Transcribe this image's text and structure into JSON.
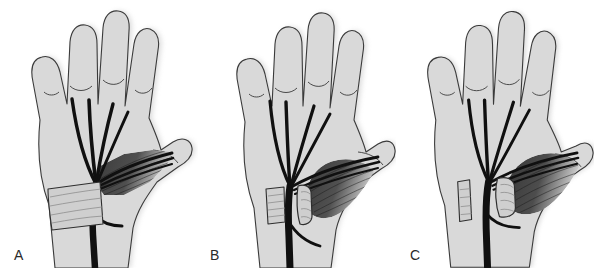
{
  "figure": {
    "background_color": "#ffffff",
    "panel_count": 3,
    "width": 595,
    "height": 268
  },
  "colors": {
    "background": "#ffffff",
    "skin_fill": "#d9d9d9",
    "skin_outline": "#3a3a3a",
    "nerve": "#101010",
    "thenar_muscle": "#4a4a4a",
    "thenar_muscle_dark": "#333333",
    "thenar_striation": "#1c1c1c",
    "ligament_fill": "#cfcfcf",
    "ligament_outline": "#2e2e2e",
    "ligament_fiber": "#8a8a8a",
    "label_text": "#2a2a2a",
    "shadow": "#bdbdbd"
  },
  "panels": [
    {
      "id": "a",
      "label": "A",
      "caption": "Transverse carpal ligament intact, spanning the wrist over the median nerve",
      "ligament_state": "intact",
      "ligament_pieces": 1,
      "nerve_visible_under_ligament": false,
      "structures": [
        "palm outline",
        "four fingers",
        "thumb",
        "median nerve trunk",
        "common digital branches",
        "recurrent motor branch",
        "thenar muscle mass",
        "transverse carpal ligament"
      ]
    },
    {
      "id": "b",
      "label": "B",
      "caption": "Transverse carpal ligament divided, cut edges beginning to separate",
      "ligament_state": "divided",
      "ligament_pieces": 2,
      "nerve_visible_under_ligament": true,
      "structures": [
        "palm outline",
        "four fingers",
        "thumb",
        "median nerve trunk",
        "common digital branches",
        "recurrent motor branch",
        "thenar muscle mass",
        "ulnar ligament stump",
        "radial ligament stump"
      ]
    },
    {
      "id": "c",
      "label": "C",
      "caption": "Ligament stumps retracted widely apart, decompressing the median nerve",
      "ligament_state": "retracted",
      "ligament_pieces": 2,
      "nerve_visible_under_ligament": true,
      "structures": [
        "palm outline",
        "four fingers",
        "thumb",
        "median nerve trunk",
        "common digital branches",
        "recurrent motor branch",
        "thenar muscle mass",
        "ulnar ligament stump",
        "radial ligament stump"
      ]
    }
  ]
}
